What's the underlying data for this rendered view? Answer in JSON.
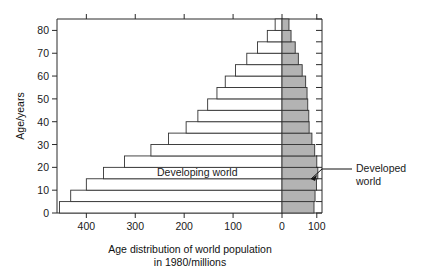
{
  "chart_data": {
    "type": "bar",
    "orientation": "horizontal",
    "subtype": "population-pyramid",
    "title": "Age distribution of world population",
    "title_line2": "in 1980/millions",
    "xlabel": "Age distribution of world population in 1980/millions",
    "ylabel": "Age/years",
    "grid": false,
    "legend_position": "inline-annotation",
    "xlim_left": [
      0,
      460
    ],
    "xlim_right": [
      0,
      115
    ],
    "ylim": [
      0,
      85
    ],
    "x_tick_labels_left": [
      "400",
      "300",
      "200",
      "100",
      "0"
    ],
    "x_tick_values_left": [
      400,
      300,
      200,
      100,
      0
    ],
    "x_tick_labels_right": [
      "100"
    ],
    "x_tick_values_right": [
      100
    ],
    "y_tick_labels": [
      "0",
      "10",
      "20",
      "30",
      "40",
      "50",
      "60",
      "70",
      "80"
    ],
    "y_tick_values": [
      0,
      10,
      20,
      30,
      40,
      50,
      60,
      70,
      80
    ],
    "categories": [
      "0-4",
      "5-9",
      "10-14",
      "15-19",
      "20-24",
      "25-29",
      "30-34",
      "35-39",
      "40-44",
      "45-49",
      "50-54",
      "55-59",
      "60-64",
      "65-69",
      "70-74",
      "75-79",
      "80+"
    ],
    "series": [
      {
        "name": "Developing world",
        "values": [
          455,
          432,
          400,
          365,
          322,
          268,
          232,
          196,
          172,
          152,
          133,
          116,
          95,
          72,
          50,
          30,
          14
        ]
      },
      {
        "name": "Developed world",
        "values": [
          92,
          95,
          99,
          103,
          100,
          94,
          86,
          78,
          77,
          74,
          72,
          68,
          58,
          47,
          38,
          26,
          20
        ]
      }
    ],
    "annotations": [
      {
        "name": "developing-world-label",
        "text": "Developing world"
      },
      {
        "name": "developed-world-label",
        "text": "Developed",
        "text2": "world"
      }
    ],
    "colors": {
      "developing_fill": "#ffffff",
      "developed_fill": "#b3b3b3",
      "stroke": "#333333",
      "background": "#ffffff"
    }
  }
}
